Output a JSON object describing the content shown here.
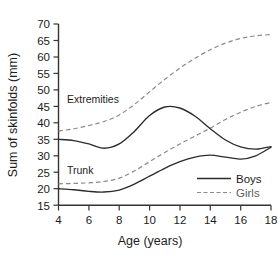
{
  "chart_data": {
    "type": "line",
    "title": "",
    "xlabel": "Age (years)",
    "ylabel": "Sum of skinfolds (mm)",
    "xlim": [
      4,
      18
    ],
    "ylim": [
      15,
      70
    ],
    "xticks": [
      4,
      6,
      8,
      10,
      12,
      14,
      16,
      18
    ],
    "yticks": [
      15,
      20,
      25,
      30,
      35,
      40,
      45,
      50,
      55,
      60,
      65,
      70
    ],
    "grid": false,
    "legend_position": "lower-right",
    "annotations": [
      {
        "text": "Extremities",
        "x": 5.6,
        "y": 46.5
      },
      {
        "text": "Trunk",
        "x": 5.4,
        "y": 24.0
      }
    ],
    "legend": [
      {
        "name": "Boys",
        "style": "solid",
        "color": "#2b2b2b"
      },
      {
        "name": "Girls",
        "style": "dashed",
        "color": "#8a8a8a"
      }
    ],
    "x": [
      4,
      5,
      6,
      7,
      8,
      9,
      10,
      11,
      12,
      13,
      14,
      15,
      16,
      17,
      18
    ],
    "series": [
      {
        "name": "Extremities - Boys",
        "group": "Extremities",
        "sex": "Boys",
        "style": "solid",
        "color": "#2b2b2b",
        "values": [
          35.0,
          34.6,
          33.6,
          32.3,
          33.6,
          37.4,
          42.2,
          44.8,
          44.5,
          42.0,
          38.2,
          34.8,
          32.7,
          32.0,
          32.8
        ]
      },
      {
        "name": "Extremities - Girls",
        "group": "Extremities",
        "sex": "Girls",
        "style": "dashed",
        "color": "#8a8a8a",
        "values": [
          37.5,
          38.2,
          39.2,
          40.4,
          42.4,
          45.6,
          49.4,
          53.2,
          56.6,
          59.6,
          62.2,
          64.2,
          65.6,
          66.4,
          66.8
        ]
      },
      {
        "name": "Trunk - Boys",
        "group": "Trunk",
        "sex": "Boys",
        "style": "solid",
        "color": "#2b2b2b",
        "values": [
          20.0,
          19.7,
          19.2,
          19.0,
          19.6,
          21.4,
          23.8,
          26.2,
          28.2,
          29.6,
          30.2,
          29.6,
          29.0,
          30.0,
          32.6
        ]
      },
      {
        "name": "Trunk - Girls",
        "group": "Trunk",
        "sex": "Girls",
        "style": "dashed",
        "color": "#8a8a8a",
        "values": [
          21.5,
          21.6,
          21.8,
          22.2,
          23.2,
          25.4,
          28.2,
          31.0,
          33.6,
          36.0,
          38.4,
          41.0,
          43.2,
          45.0,
          46.2
        ]
      }
    ]
  },
  "axes": {
    "xlabel": "Age (years)",
    "ylabel": "Sum of skinfolds (mm)",
    "xticks": [
      "4",
      "6",
      "8",
      "10",
      "12",
      "14",
      "16",
      "18"
    ],
    "yticks": [
      "70",
      "65",
      "60",
      "55",
      "50",
      "45",
      "40",
      "35",
      "30",
      "25",
      "20",
      "15"
    ]
  },
  "annotations": {
    "extremities": "Extremities",
    "trunk": "Trunk"
  },
  "legend": {
    "boys": "Boys",
    "girls": "Girls"
  }
}
